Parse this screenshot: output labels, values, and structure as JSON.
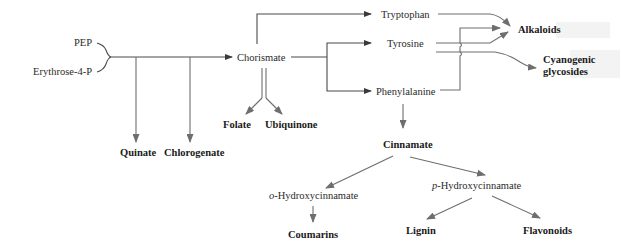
{
  "diagram": {
    "nodes": {
      "pep": "PEP",
      "erythrose": "Erythrose-4-P",
      "chorismate": "Chorismate",
      "tryptophan": "Tryptophan",
      "tyrosine": "Tyrosine",
      "phenylalanine": "Phenylalanine",
      "alkaloids": "Alkaloids",
      "cyanogenic_1": "Cyanogenic",
      "cyanogenic_2": "glycosides",
      "folate": "Folate",
      "ubiquinone": "Ubiquinone",
      "quinate": "Quinate",
      "chlorogenate": "Chlorogenate",
      "cinnamate": "Cinnamate",
      "o_prefix": "o",
      "o_hydroxy": "-Hydroxycinnamate",
      "p_prefix": "p",
      "p_hydroxy": "-Hydroxycinnamate",
      "coumarins": "Coumarins",
      "lignin": "Lignin",
      "flavonoids": "Flavonoids"
    },
    "edges": [
      {
        "from": "PEP + Erythrose-4-P",
        "to": "Chorismate"
      },
      {
        "from": "PEP + Erythrose-4-P",
        "to": "Quinate"
      },
      {
        "from": "PEP + Erythrose-4-P",
        "to": "Chlorogenate"
      },
      {
        "from": "Chorismate",
        "to": "Tryptophan"
      },
      {
        "from": "Chorismate",
        "to": "Tyrosine"
      },
      {
        "from": "Chorismate",
        "to": "Phenylalanine"
      },
      {
        "from": "Chorismate",
        "to": "Folate"
      },
      {
        "from": "Chorismate",
        "to": "Ubiquinone"
      },
      {
        "from": "Tryptophan",
        "to": "Alkaloids"
      },
      {
        "from": "Tyrosine",
        "to": "Alkaloids"
      },
      {
        "from": "Phenylalanine",
        "to": "Alkaloids"
      },
      {
        "from": "Tyrosine",
        "to": "Cyanogenic glycosides"
      },
      {
        "from": "Phenylalanine",
        "to": "Cinnamate"
      },
      {
        "from": "Cinnamate",
        "to": "o-Hydroxycinnamate"
      },
      {
        "from": "Cinnamate",
        "to": "p-Hydroxycinnamate"
      },
      {
        "from": "o-Hydroxycinnamate",
        "to": "Coumarins"
      },
      {
        "from": "p-Hydroxycinnamate",
        "to": "Lignin"
      },
      {
        "from": "p-Hydroxycinnamate",
        "to": "Flavonoids"
      }
    ],
    "colors": {
      "background": "#ffffff",
      "line": "#4a4a4a",
      "arrow": "#6e6e6e",
      "text": "#2a2a2a",
      "highlight": "#f2f2f2"
    }
  }
}
